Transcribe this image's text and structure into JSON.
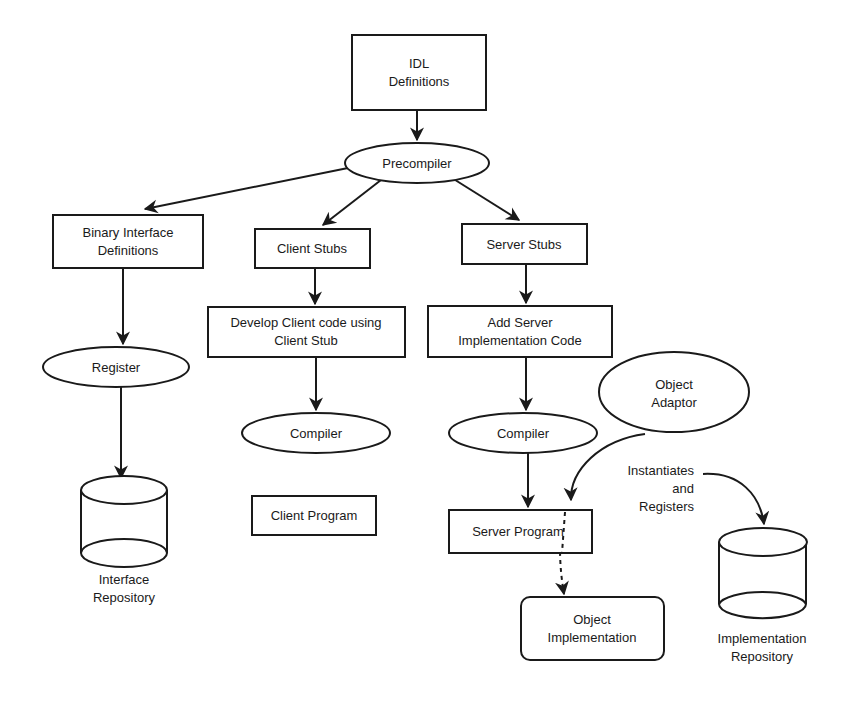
{
  "diagram": {
    "nodes": {
      "idl": {
        "line1": "IDL",
        "line2": "Definitions"
      },
      "precompiler": {
        "label": "Precompiler"
      },
      "binary_interface": {
        "line1": "Binary Interface",
        "line2": "Definitions"
      },
      "client_stubs": {
        "label": "Client Stubs"
      },
      "server_stubs": {
        "label": "Server Stubs"
      },
      "develop_client": {
        "line1": "Develop Client code using",
        "line2": "Client Stub"
      },
      "add_server_impl": {
        "line1": "Add Server",
        "line2": "Implementation Code"
      },
      "register": {
        "label": "Register"
      },
      "client_compiler": {
        "label": "Compiler"
      },
      "server_compiler": {
        "label": "Compiler"
      },
      "object_adaptor": {
        "line1": "Object",
        "line2": "Adaptor"
      },
      "client_program": {
        "label": "Client Program"
      },
      "server_program": {
        "label": "Server Program"
      },
      "interface_repository": {
        "line1": "Interface",
        "line2": "Repository"
      },
      "implementation_repository": {
        "line1": "Implementation",
        "line2": "Repository"
      },
      "object_implementation": {
        "line1": "Object",
        "line2": "Implementation"
      }
    },
    "annotations": {
      "instantiates": {
        "line1": "Instantiates",
        "line2": "and",
        "line3": "Registers"
      }
    },
    "edges": [
      {
        "from": "IDL Definitions",
        "to": "Precompiler",
        "style": "solid"
      },
      {
        "from": "Precompiler",
        "to": "Binary Interface Definitions",
        "style": "solid"
      },
      {
        "from": "Precompiler",
        "to": "Client Stubs",
        "style": "solid"
      },
      {
        "from": "Precompiler",
        "to": "Server Stubs",
        "style": "solid"
      },
      {
        "from": "Binary Interface Definitions",
        "to": "Register",
        "style": "solid"
      },
      {
        "from": "Register",
        "to": "Interface Repository",
        "style": "solid"
      },
      {
        "from": "Client Stubs",
        "to": "Develop Client code using Client Stub",
        "style": "solid"
      },
      {
        "from": "Develop Client code using Client Stub",
        "to": "Compiler",
        "style": "solid"
      },
      {
        "from": "Server Stubs",
        "to": "Add Server Implementation Code",
        "style": "solid"
      },
      {
        "from": "Add Server Implementation Code",
        "to": "Compiler",
        "style": "solid"
      },
      {
        "from": "Compiler",
        "to": "Server Program",
        "style": "solid"
      },
      {
        "from": "Object Adaptor",
        "to": "Server Program",
        "style": "curved"
      },
      {
        "from": "Instantiates and Registers",
        "to": "Implementation Repository",
        "style": "curved"
      },
      {
        "from": "Server Program",
        "to": "Object Implementation",
        "style": "dashed"
      }
    ]
  }
}
